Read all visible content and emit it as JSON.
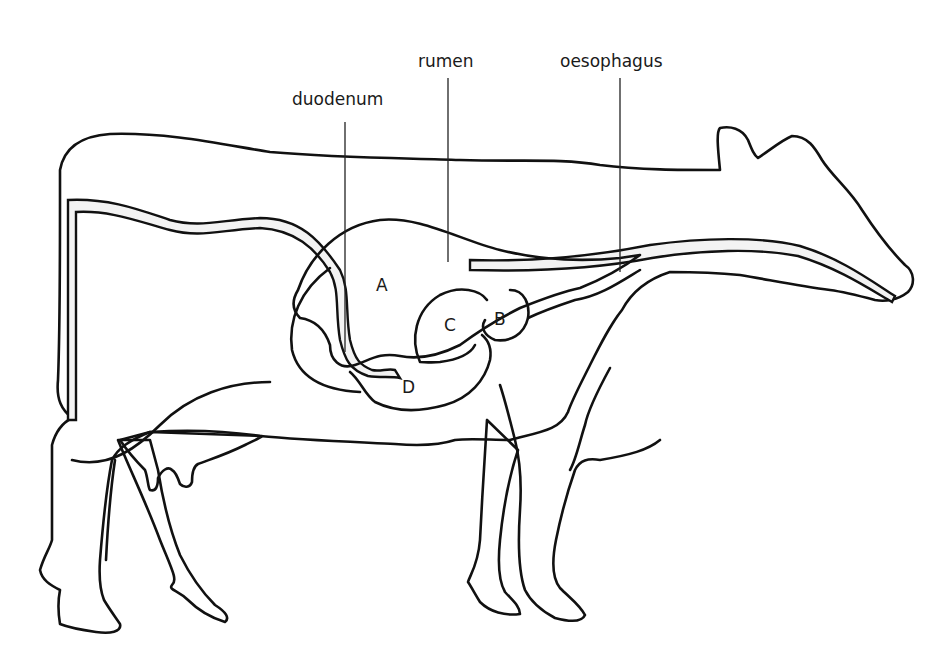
{
  "diagram": {
    "labels": [
      {
        "id": "duodenum",
        "text": "duodenum"
      },
      {
        "id": "rumen",
        "text": "rumen"
      },
      {
        "id": "oesophagus",
        "text": "oesophagus"
      }
    ],
    "compartments": [
      {
        "id": "A",
        "text": "A"
      },
      {
        "id": "B",
        "text": "B"
      },
      {
        "id": "C",
        "text": "C"
      },
      {
        "id": "D",
        "text": "D"
      }
    ],
    "colors": {
      "body_light": "#e6e6e6",
      "body_dark": "#9a9a9a",
      "tract_fill": "#f2f2f2",
      "outline": "#111111",
      "background": "#ffffff"
    }
  }
}
